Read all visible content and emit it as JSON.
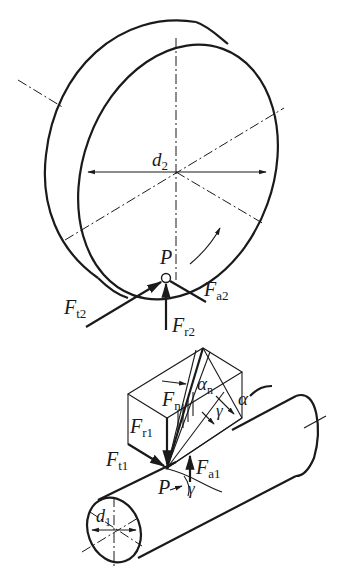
{
  "diagram": {
    "wheel": {
      "diameter_label": {
        "main": "d",
        "sub": "2"
      },
      "pitch_point": "P",
      "forces": [
        {
          "main": "F",
          "sub": "t2"
        },
        {
          "main": "F",
          "sub": "a2"
        },
        {
          "main": "F",
          "sub": "r2"
        }
      ],
      "rotation_direction": "arrow-ccw"
    },
    "worm": {
      "diameter_label": {
        "main": "d",
        "sub": "1"
      },
      "pitch_point": "P",
      "forces": [
        {
          "main": "F",
          "sub": "n"
        },
        {
          "main": "F",
          "sub": "r1"
        },
        {
          "main": "F",
          "sub": "t1"
        },
        {
          "main": "F",
          "sub": "a1"
        }
      ],
      "angles": [
        {
          "main": "α",
          "sub": "n"
        },
        {
          "main": "α",
          "sub": ""
        },
        {
          "main": "γ",
          "sub": ""
        },
        {
          "main": "γ",
          "sub": "lead"
        }
      ]
    }
  }
}
